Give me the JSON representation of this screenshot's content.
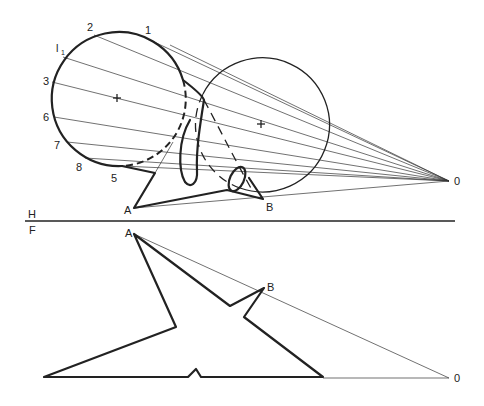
{
  "figure": {
    "colors": {
      "ink": "#222222",
      "background": "#ffffff"
    }
  },
  "labels": {
    "point_1": "1",
    "point_2": "2",
    "point_l1": "l",
    "point_l1_sub": "1",
    "point_3": "3",
    "point_6": "6",
    "point_7": "7",
    "point_8": "8",
    "point_5": "5",
    "top_A": "A",
    "top_B": "B",
    "top_O": "0",
    "fold_H": "H",
    "fold_F": "F",
    "front_A": "A",
    "front_B": "B",
    "front_O": "0"
  },
  "views": {
    "top": {
      "name": "H",
      "left_circle": {
        "cx": 117,
        "cy": 98,
        "r": 67
      },
      "right_circle": {
        "cx": 261,
        "cy": 124,
        "r": 67
      },
      "light_source": {
        "x": 449,
        "y": 181
      }
    },
    "fold_line": {
      "y": 221,
      "x1": 25,
      "x2": 455
    },
    "front": {
      "name": "F",
      "light_source": {
        "x": 449,
        "y": 378
      }
    }
  }
}
